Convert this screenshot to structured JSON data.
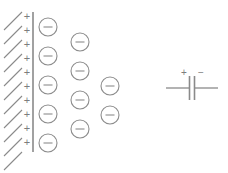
{
  "figure": {
    "name": "electric-double-layer-diagram",
    "type": "diagram",
    "background_color": "#ffffff",
    "stroke_color": "#8a8a8a",
    "width": 228,
    "height": 173
  },
  "electrode": {
    "name": "hatched-electrode-wall",
    "wall_x": 33,
    "wall_y_top": 12,
    "wall_y_bottom": 152,
    "hatch_count": 11,
    "hatch_length": 20,
    "hatch_angle_deg": -45,
    "hatch_lines": [
      {
        "x1": 4,
        "y1": 30,
        "x2": 22,
        "y2": 12
      },
      {
        "x1": 4,
        "y1": 44,
        "x2": 22,
        "y2": 26
      },
      {
        "x1": 4,
        "y1": 58,
        "x2": 22,
        "y2": 40
      },
      {
        "x1": 4,
        "y1": 72,
        "x2": 22,
        "y2": 54
      },
      {
        "x1": 4,
        "y1": 86,
        "x2": 22,
        "y2": 68
      },
      {
        "x1": 4,
        "y1": 100,
        "x2": 22,
        "y2": 82
      },
      {
        "x1": 4,
        "y1": 114,
        "x2": 22,
        "y2": 96
      },
      {
        "x1": 4,
        "y1": 128,
        "x2": 22,
        "y2": 110
      },
      {
        "x1": 4,
        "y1": 142,
        "x2": 22,
        "y2": 124
      },
      {
        "x1": 4,
        "y1": 156,
        "x2": 22,
        "y2": 138
      },
      {
        "x1": 4,
        "y1": 170,
        "x2": 22,
        "y2": 152
      }
    ]
  },
  "positive_charges": {
    "name": "surface-positive-charges",
    "symbol": "+",
    "count": 10,
    "x": 27,
    "y_positions": [
      17,
      31,
      45,
      59,
      73,
      87,
      101,
      115,
      129,
      143
    ]
  },
  "negative_ions": {
    "name": "negative-ions-in-solution",
    "symbol": "−",
    "radius": 9,
    "count": 11,
    "columns": [
      {
        "column_index": 1,
        "x": 48,
        "count": 5,
        "y_positions": [
          27,
          56,
          85,
          114,
          143
        ]
      },
      {
        "column_index": 2,
        "x": 80,
        "count": 4,
        "y_positions": [
          42,
          71,
          100,
          129
        ]
      },
      {
        "column_index": 3,
        "x": 110,
        "count": 2,
        "y_positions": [
          86,
          115
        ]
      }
    ]
  },
  "capacitor_symbol": {
    "name": "equivalent-capacitor-symbol",
    "center_x": 192,
    "center_y": 88,
    "lead_left_x": 166,
    "lead_right_x": 218,
    "plate_gap": 5,
    "plate_half_height": 12,
    "plus_label": "+",
    "minus_label": "−",
    "plus_x": 184,
    "minus_x": 201,
    "label_y": 73
  }
}
